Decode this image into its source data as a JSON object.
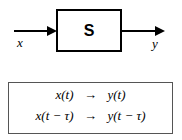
{
  "figure": {
    "type": "block-diagram-with-equations",
    "background_color": "#ffffff",
    "line_color": "#000000"
  },
  "diagram": {
    "block_label": "S",
    "input_signal_label": "x",
    "output_signal_label": "y",
    "input_arrow_icon": "arrow-right-icon",
    "output_arrow_icon": "arrow-right-icon"
  },
  "equations": {
    "rows": [
      {
        "lhs": "x(t)",
        "arrow": "→",
        "rhs": "y(t)"
      },
      {
        "lhs": "x(t − τ)",
        "arrow": "→",
        "rhs": "y(t − τ)"
      }
    ]
  }
}
